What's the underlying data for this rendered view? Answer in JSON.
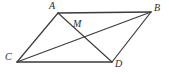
{
  "figure": {
    "type": "geometry-diagram",
    "background_color": "#ffffff",
    "stroke_color": "#3a3a3a",
    "label_color": "#2b2b2b",
    "canvas": {
      "width": 169,
      "height": 74
    },
    "points": [
      {
        "id": "A",
        "label": "A",
        "x": 58,
        "y": 13,
        "label_x": 49,
        "label_y": 1
      },
      {
        "id": "B",
        "label": "B",
        "x": 151,
        "y": 12,
        "label_x": 154,
        "label_y": 3
      },
      {
        "id": "C",
        "label": "C",
        "x": 17,
        "y": 62,
        "label_x": 5,
        "label_y": 52
      },
      {
        "id": "D",
        "label": "D",
        "x": 112,
        "y": 62,
        "label_x": 115,
        "label_y": 59
      },
      {
        "id": "M",
        "label": "M",
        "x": 80,
        "y": 32,
        "label_x": 73,
        "label_y": 19
      }
    ],
    "segments": [
      {
        "id": "AB",
        "from": "A",
        "to": "B",
        "role": "side",
        "x1": 58,
        "y1": 13,
        "x2": 151,
        "y2": 12
      },
      {
        "id": "CD",
        "from": "C",
        "to": "D",
        "role": "side",
        "x1": 17,
        "y1": 62,
        "x2": 112,
        "y2": 62
      },
      {
        "id": "AC",
        "from": "A",
        "to": "C",
        "role": "side",
        "x1": 58,
        "y1": 13,
        "x2": 17,
        "y2": 62
      },
      {
        "id": "BD",
        "from": "B",
        "to": "D",
        "role": "side",
        "x1": 151,
        "y1": 12,
        "x2": 112,
        "y2": 62
      },
      {
        "id": "AD",
        "from": "A",
        "to": "D",
        "role": "diagonal",
        "x1": 58,
        "y1": 13,
        "x2": 112,
        "y2": 62
      },
      {
        "id": "CB",
        "from": "C",
        "to": "B",
        "role": "diagonal",
        "x1": 17,
        "y1": 62,
        "x2": 151,
        "y2": 12
      }
    ],
    "labels": {
      "a": "A",
      "b": "B",
      "c": "C",
      "d": "D",
      "m": "M"
    }
  }
}
